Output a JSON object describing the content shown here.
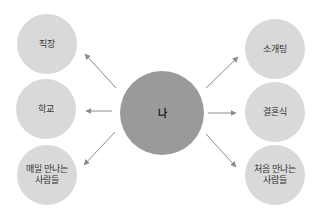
{
  "diagram": {
    "center": {
      "label": "나",
      "x": 162,
      "y": 113,
      "r": 42,
      "color": "#9a9a9a"
    },
    "nodes": [
      {
        "id": "workplace",
        "label": "직장",
        "x": 47,
        "y": 44,
        "r": 30
      },
      {
        "id": "school",
        "label": "학교",
        "x": 46,
        "y": 109,
        "r": 30
      },
      {
        "id": "daily-people",
        "label": "매일 만나는 사람들",
        "x": 47,
        "y": 175,
        "r": 30
      },
      {
        "id": "blind-date",
        "label": "소개팅",
        "x": 275,
        "y": 49,
        "r": 30
      },
      {
        "id": "wedding",
        "label": "결혼식",
        "x": 275,
        "y": 112,
        "r": 30
      },
      {
        "id": "new-people",
        "label": "처음 만나는 사람들",
        "x": 275,
        "y": 175,
        "r": 30
      }
    ],
    "node_color": "#d9d9d9",
    "arrow_color": "#8c8c8c",
    "arrows": [
      {
        "from": "center",
        "to": "workplace"
      },
      {
        "from": "center",
        "to": "school"
      },
      {
        "from": "center",
        "to": "daily-people"
      },
      {
        "from": "center",
        "to": "blind-date"
      },
      {
        "from": "center",
        "to": "wedding"
      },
      {
        "from": "center",
        "to": "new-people"
      }
    ]
  }
}
